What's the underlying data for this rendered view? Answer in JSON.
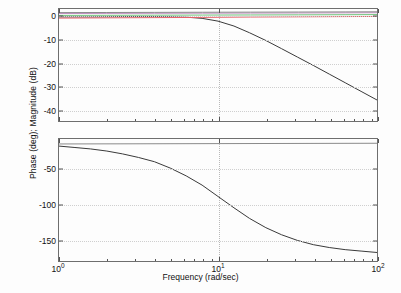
{
  "figure": {
    "xlabel": "Frequency (rad/sec)",
    "ylabel": "Phase (deg); Magnitude (dB)",
    "background": "#ffffff",
    "axis_color": "#6e6e6e",
    "grid_color": "#c8c8c8"
  },
  "xaxis": {
    "ticks": [
      {
        "label_base": "10",
        "label_exp": "0",
        "value": 1
      },
      {
        "label_base": "10",
        "label_exp": "1",
        "value": 10
      },
      {
        "label_base": "10",
        "label_exp": "2",
        "value": 100
      }
    ],
    "scale": "log",
    "min": 1,
    "max": 100
  },
  "chart_data": [
    {
      "type": "line",
      "title": "",
      "name": "magnitude",
      "xlabel": "",
      "ylabel": "Magnitude (dB)",
      "xscale": "log",
      "xlim": [
        1,
        100
      ],
      "ylim": [
        -45,
        3
      ],
      "ytick_labels": [
        "0",
        "-10",
        "-20",
        "-30",
        "-40"
      ],
      "ytick_values": [
        0,
        -10,
        -20,
        -30,
        -40
      ],
      "grid": true,
      "legend": "none",
      "series": [
        {
          "name": "magnitude-main",
          "color": "#3a3a3a",
          "x": [
            1,
            1.26,
            1.58,
            2,
            2.51,
            3.16,
            3.98,
            5.01,
            6.31,
            7.94,
            10,
            12.6,
            15.8,
            20,
            25.1,
            31.6,
            39.8,
            50.1,
            63.1,
            79.4,
            100
          ],
          "y": [
            -0.4,
            -0.4,
            -0.4,
            -0.35,
            -0.3,
            -0.3,
            -0.3,
            -0.35,
            -0.5,
            -1.0,
            -2.2,
            -4.3,
            -7.2,
            -10.5,
            -14.0,
            -17.6,
            -21.2,
            -24.9,
            -28.6,
            -32.3,
            -36.0
          ]
        },
        {
          "name": "magnitude-red",
          "color": "#e8616a",
          "x": [
            1,
            2,
            4,
            8,
            16,
            32,
            63,
            100
          ],
          "y": [
            -0.9,
            -0.8,
            -0.7,
            -0.6,
            -0.45,
            -0.35,
            -0.25,
            -0.2
          ]
        },
        {
          "name": "magnitude-green",
          "color": "#6fc27a",
          "x": [
            1,
            2,
            4,
            8,
            16,
            32,
            63,
            100
          ],
          "y": [
            0.25,
            0.3,
            0.35,
            0.4,
            0.45,
            0.5,
            0.55,
            0.6
          ]
        },
        {
          "name": "magnitude-magenta",
          "color": "#c48fc4",
          "x": [
            1,
            2,
            4,
            8,
            16,
            32,
            63,
            100
          ],
          "y": [
            1.05,
            1.1,
            1.15,
            1.2,
            1.25,
            1.3,
            1.35,
            1.4
          ]
        },
        {
          "name": "magnitude-gray-top",
          "color": "#8a8a8a",
          "x": [
            1,
            2,
            4,
            8,
            16,
            32,
            63,
            100
          ],
          "y": [
            1.45,
            1.5,
            1.55,
            1.6,
            1.65,
            1.7,
            1.75,
            1.8
          ]
        }
      ]
    },
    {
      "type": "line",
      "title": "",
      "name": "phase",
      "xlabel": "Frequency (rad/sec)",
      "ylabel": "Phase (deg)",
      "xscale": "log",
      "xlim": [
        1,
        100
      ],
      "ylim": [
        -180,
        -8
      ],
      "ytick_labels": [
        "-50",
        "-100",
        "-150"
      ],
      "ytick_values": [
        -50,
        -100,
        -150
      ],
      "grid": true,
      "legend": "none",
      "series": [
        {
          "name": "phase-main",
          "color": "#3a3a3a",
          "x": [
            1,
            1.26,
            1.58,
            2,
            2.51,
            3.16,
            3.98,
            5.01,
            6.31,
            7.94,
            10,
            12.6,
            15.8,
            20,
            25.1,
            31.6,
            39.8,
            50.1,
            63.1,
            79.4,
            100
          ],
          "y": [
            -18,
            -20,
            -22,
            -25,
            -29,
            -34,
            -40,
            -49,
            -60,
            -73,
            -89,
            -105,
            -120,
            -133,
            -143,
            -151,
            -157,
            -161,
            -164,
            -166,
            -168
          ]
        },
        {
          "name": "phase-gray-top",
          "color": "#8a8a8a",
          "x": [
            1,
            100
          ],
          "y": [
            -15,
            -14
          ]
        }
      ]
    }
  ]
}
